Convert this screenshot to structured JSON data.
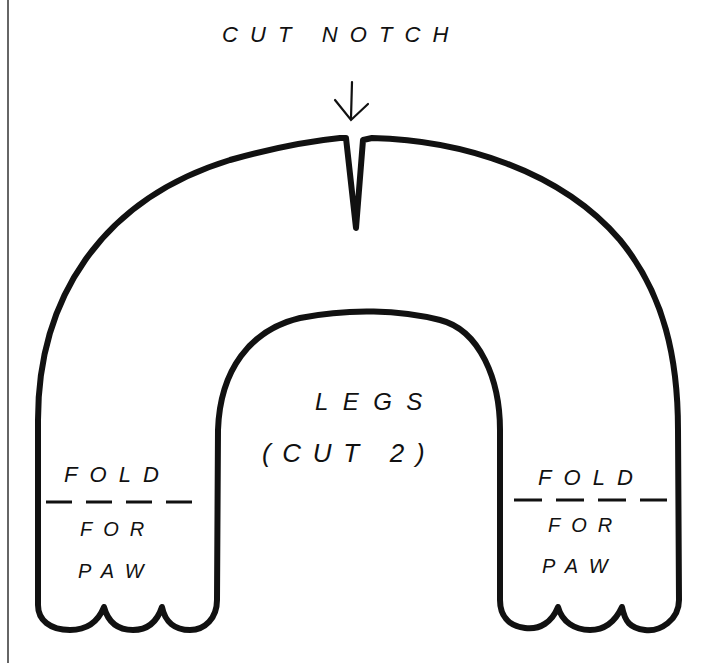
{
  "diagram": {
    "type": "sewing-pattern-piece",
    "piece_name": "LEGS",
    "instructions": {
      "notch_label": "CUT NOTCH",
      "piece_title": "LEGS",
      "cut_count": "(CUT 2)",
      "fold_left": {
        "line1": "FOLD",
        "line2": "FOR",
        "line3": "PAW"
      },
      "fold_right": {
        "line1": "FOLD",
        "line2": "FOR",
        "line3": "PAW"
      }
    },
    "colors": {
      "line": "#111111",
      "background": "#ffffff"
    }
  }
}
